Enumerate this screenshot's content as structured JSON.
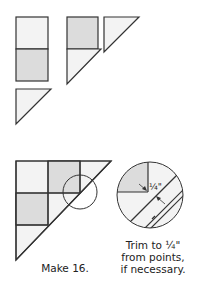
{
  "figure": {
    "captions": {
      "make": "Make 16.",
      "trim_line1": "Trim to ¼\"",
      "trim_line2": "from points,",
      "trim_line3": "if necessary."
    },
    "detail_label": "¼\"",
    "colors": {
      "light_fill": "#f3f3f3",
      "dark_fill": "#dcdcdc",
      "stroke": "#333333"
    }
  }
}
